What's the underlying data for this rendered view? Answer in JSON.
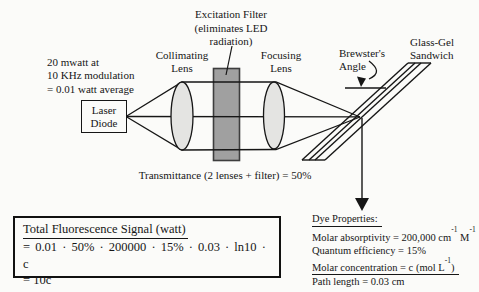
{
  "colors": {
    "background": "#fbfbf9",
    "ink": "#161616",
    "filter_fill": "#a0a0a0",
    "filter_border": "#3d3d3d",
    "lens_fill": "#e4e4e2"
  },
  "labels": {
    "excitation_filter": {
      "lines": [
        "Excitation Filter",
        "(eliminates LED",
        "radiation)"
      ]
    },
    "collimating_lens": {
      "lines": [
        "Collimating",
        "Lens"
      ]
    },
    "focusing_lens": {
      "lines": [
        "Focusing",
        "Lens"
      ]
    },
    "brewster_angle": {
      "lines": [
        "Brewster's",
        "Angle"
      ]
    },
    "glass_gel_sandwich": {
      "lines": [
        "Glass-Gel",
        "Sandwich"
      ]
    },
    "laser_power": {
      "lines": [
        "20 mwatt at",
        "10 KHz modulation",
        "= 0.01 watt average"
      ]
    },
    "laser_diode": {
      "lines": [
        "Laser",
        "Diode"
      ]
    },
    "transmittance": "Transmittance (2 lenses + filter) = 50%"
  },
  "signal_box": {
    "title": "Total Fluorescence Signal (watt)",
    "equation": "= 0.01 · 50% · 200000 · 15% · 0.03 · ln10 · c",
    "result": "= 10c"
  },
  "dye_properties": {
    "title": "Dye Properties:",
    "absorptivity": {
      "prefix": "Molar absorptivity = 200,000 cm",
      "sup1": "-1",
      "mid": " M",
      "sup2": "-1"
    },
    "quantum": "Quantum efficiency = 15%",
    "concentration": {
      "prefix": "Molar concentration = c (mol L",
      "sup": "-1",
      "suffix": ")"
    },
    "path_length": "Path length = 0.03 cm"
  }
}
